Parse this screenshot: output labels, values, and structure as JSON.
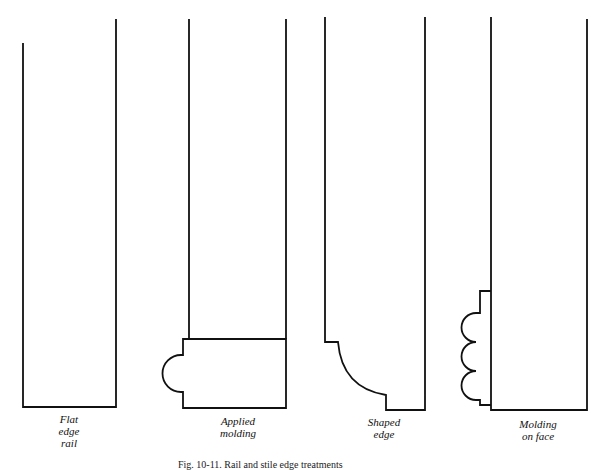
{
  "figure": {
    "stroke_color": "#111111",
    "background": "#ffffff",
    "panels": [
      {
        "id": "flat-edge-rail",
        "label_lines": [
          "Flat",
          "edge",
          "rail"
        ]
      },
      {
        "id": "applied-molding",
        "label_lines": [
          "Applied",
          "molding"
        ]
      },
      {
        "id": "shaped-edge",
        "label_lines": [
          "Shaped",
          "edge"
        ]
      },
      {
        "id": "molding-on-face",
        "label_lines": [
          "Molding",
          "on face"
        ]
      }
    ],
    "caption": "Fig. 10-11. Rail and stile edge treatments"
  }
}
